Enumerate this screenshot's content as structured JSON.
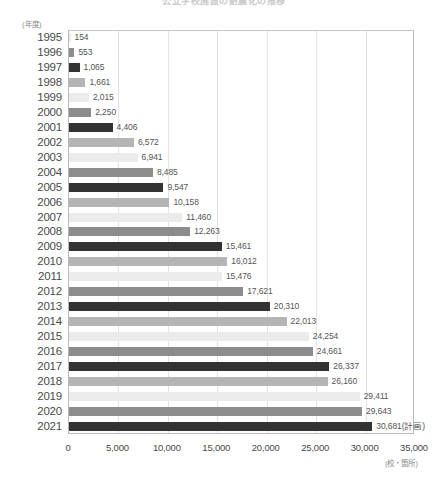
{
  "chart_data": {
    "type": "bar",
    "orientation": "horizontal",
    "title": "公立学校施設の耐震化の推移",
    "xlabel": "(校・箇所)",
    "ylabel": "(年度)",
    "xlim": [
      0,
      35000
    ],
    "xticks": [
      "0",
      "5,000",
      "10,000",
      "15,000",
      "20,000",
      "25,000",
      "30,000",
      "35,000"
    ],
    "xtick_values": [
      0,
      5000,
      10000,
      15000,
      20000,
      25000,
      30000,
      35000
    ],
    "grid": true,
    "legend": "none",
    "categories": [
      "1995",
      "1996",
      "1997",
      "1998",
      "1999",
      "2000",
      "2001",
      "2002",
      "2003",
      "2004",
      "2005",
      "2006",
      "2007",
      "2008",
      "2009",
      "2010",
      "2011",
      "2012",
      "2013",
      "2014",
      "2015",
      "2016",
      "2017",
      "2018",
      "2019",
      "2020",
      "2021"
    ],
    "values": [
      154,
      553,
      1065,
      1661,
      2015,
      2250,
      4406,
      6572,
      6941,
      8485,
      9547,
      10158,
      11460,
      12263,
      15461,
      16012,
      15476,
      17621,
      20310,
      22013,
      24254,
      24661,
      26337,
      26160,
      29411,
      29643,
      30681
    ],
    "value_labels": [
      "154",
      "553",
      "1,065",
      "1,661",
      "2,015",
      "2,250",
      "4,406",
      "6,572",
      "6,941",
      "8,485",
      "9,547",
      "10,158",
      "11,460",
      "12,263",
      "15,461",
      "16,012",
      "15,476",
      "17,621",
      "20,310",
      "22,013",
      "24,254",
      "24,661",
      "26,337",
      "26,160",
      "29,411",
      "29,643",
      "30,681(計画)"
    ],
    "bar_colors": [
      "#ebebeb",
      "#8c8c8c",
      "#333333",
      "#b5b5b5"
    ],
    "color_cycle_length": 4,
    "annotations": [
      "2021年度は計画値"
    ]
  }
}
